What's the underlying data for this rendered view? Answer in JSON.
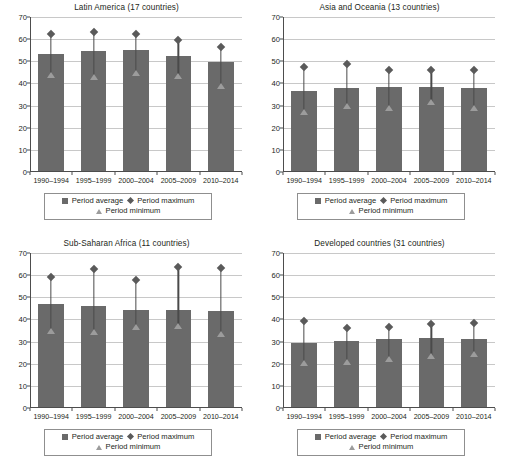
{
  "figure": {
    "legend": {
      "average_label": "Period average",
      "maximum_label": "Period maximum",
      "minimum_label": "Period minimum"
    },
    "colors": {
      "bar": "#6a6a6a",
      "maximum_marker": "#5a5a5a",
      "minimum_marker": "#9c9c9c",
      "gridline": "#c8c8c8",
      "axis": "#4d4d4d",
      "text": "#231f20",
      "background": "#ffffff"
    }
  },
  "chart_data": [
    {
      "type": "bar",
      "panel": "top-left",
      "title": "Latin America (17 countries)",
      "xlabel": "",
      "ylabel": "",
      "ylim": [
        0,
        70
      ],
      "yticks": [
        0,
        10,
        20,
        30,
        40,
        50,
        60,
        70
      ],
      "grid": true,
      "legend_position": "below",
      "categories": [
        "1990–1994",
        "1995–1999",
        "2000–2004",
        "2005–2009",
        "2010–2014"
      ],
      "series": [
        {
          "name": "Period average",
          "values": [
            53.0,
            54.4,
            54.5,
            52.1,
            49.4
          ]
        },
        {
          "name": "Period maximum",
          "values": [
            62.2,
            63.3,
            62.3,
            59.5,
            56.6
          ]
        },
        {
          "name": "Period minimum",
          "values": [
            44.0,
            42.9,
            44.7,
            43.3,
            38.8
          ]
        }
      ]
    },
    {
      "type": "bar",
      "panel": "top-right",
      "title": "Asia and Oceania (13 countries)",
      "xlabel": "",
      "ylabel": "",
      "ylim": [
        0,
        70
      ],
      "yticks": [
        0,
        10,
        20,
        30,
        40,
        50,
        60,
        70
      ],
      "grid": true,
      "legend_position": "below",
      "categories": [
        "1990–1994",
        "1995–1999",
        "2000–2004",
        "2005–2009",
        "2010–2014"
      ],
      "series": [
        {
          "name": "Period average",
          "values": [
            36.3,
            37.3,
            38.0,
            38.0,
            37.3
          ]
        },
        {
          "name": "Period maximum",
          "values": [
            47.6,
            48.9,
            46.0,
            46.1,
            46.2
          ]
        },
        {
          "name": "Period minimum",
          "values": [
            26.9,
            29.6,
            29.1,
            31.4,
            29.1
          ]
        }
      ]
    },
    {
      "type": "bar",
      "panel": "bottom-left",
      "title": "Sub-Saharan Africa (11 countries)",
      "xlabel": "",
      "ylabel": "",
      "ylim": [
        0,
        70
      ],
      "yticks": [
        0,
        10,
        20,
        30,
        40,
        50,
        60,
        70
      ],
      "grid": true,
      "legend_position": "below",
      "categories": [
        "1990–1994",
        "1995–1999",
        "2000–2004",
        "2005–2009",
        "2010–2014"
      ],
      "series": [
        {
          "name": "Period average",
          "values": [
            46.5,
            45.6,
            43.9,
            43.9,
            43.2
          ]
        },
        {
          "name": "Period maximum",
          "values": [
            59.3,
            62.8,
            57.6,
            63.6,
            63.1
          ]
        },
        {
          "name": "Period minimum",
          "values": [
            34.7,
            34.5,
            36.5,
            36.9,
            33.3
          ]
        }
      ]
    },
    {
      "type": "bar",
      "panel": "bottom-right",
      "title": "Developed countries (31 countries)",
      "xlabel": "",
      "ylabel": "",
      "ylim": [
        0,
        70
      ],
      "yticks": [
        0,
        10,
        20,
        30,
        40,
        50,
        60,
        70
      ],
      "grid": true,
      "legend_position": "below",
      "categories": [
        "1990–1994",
        "1995–1999",
        "2000–2004",
        "2005–2009",
        "2010–2014"
      ],
      "series": [
        {
          "name": "Period average",
          "values": [
            29.0,
            29.8,
            30.5,
            31.2,
            30.8
          ]
        },
        {
          "name": "Period maximum",
          "values": [
            39.3,
            36.0,
            36.7,
            37.9,
            38.5
          ]
        },
        {
          "name": "Period minimum",
          "values": [
            20.4,
            20.6,
            22.1,
            23.4,
            24.6
          ]
        }
      ]
    }
  ]
}
